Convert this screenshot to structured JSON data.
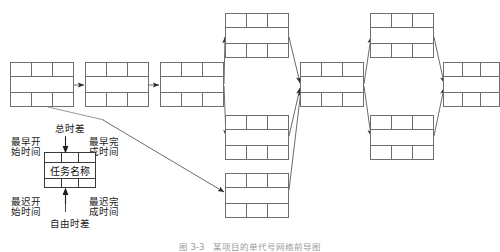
{
  "figure": {
    "type": "precedence-network-diagram",
    "caption": "图 3-3　某项目的单代号网络前导图",
    "legend": {
      "title_top": "总时差",
      "title_bottom": "自由时差",
      "top_left": "最早开\n始时间",
      "top_left_line1": "最早开",
      "top_left_line2": "始时间",
      "top_right_line1": "最早完",
      "top_right_line2": "成时间",
      "bottom_left_line1": "最迟开",
      "bottom_left_line2": "始时间",
      "bottom_right_line1": "最迟完",
      "bottom_right_line2": "成时间",
      "box_center_label": "任务名称"
    },
    "nodes": [
      {
        "id": "n1",
        "x": 10,
        "y": 62,
        "w": 64,
        "h": 45,
        "label": ""
      },
      {
        "id": "n2",
        "x": 85,
        "y": 62,
        "w": 64,
        "h": 45,
        "label": ""
      },
      {
        "id": "n3",
        "x": 160,
        "y": 62,
        "w": 64,
        "h": 45,
        "label": ""
      },
      {
        "id": "n4",
        "x": 225,
        "y": 13,
        "w": 64,
        "h": 45,
        "label": ""
      },
      {
        "id": "n5",
        "x": 225,
        "y": 173,
        "w": 64,
        "h": 45,
        "label": ""
      },
      {
        "id": "n6",
        "x": 225,
        "y": 115,
        "w": 64,
        "h": 45,
        "label": ""
      },
      {
        "id": "n7",
        "x": 300,
        "y": 62,
        "w": 64,
        "h": 45,
        "label": ""
      },
      {
        "id": "n8",
        "x": 370,
        "y": 13,
        "w": 64,
        "h": 45,
        "label": ""
      },
      {
        "id": "n9",
        "x": 370,
        "y": 115,
        "w": 64,
        "h": 45,
        "label": ""
      },
      {
        "id": "n10",
        "x": 443,
        "y": 62,
        "w": 57,
        "h": 45,
        "label": ""
      }
    ],
    "edges": [
      {
        "from": "n1",
        "to": "n2"
      },
      {
        "from": "n2",
        "to": "n3"
      },
      {
        "from": "n3",
        "to": "n4"
      },
      {
        "from": "n3",
        "to": "n6"
      },
      {
        "from": "n4",
        "to": "n7"
      },
      {
        "from": "n6",
        "to": "n7"
      },
      {
        "from": "n7",
        "to": "n8"
      },
      {
        "from": "n7",
        "to": "n9"
      },
      {
        "from": "n8",
        "to": "n10"
      },
      {
        "from": "n9",
        "to": "n10"
      },
      {
        "from": "n5",
        "to": "n7"
      },
      {
        "from": "legend",
        "to": "n5"
      }
    ],
    "colors": {
      "box_border": "#6e6e6e",
      "legend_border": "#3a3a3a",
      "arrow": "#555555",
      "text": "#1a1a1a",
      "caption_text": "#9a9a9a",
      "background": "#ffffff"
    }
  }
}
